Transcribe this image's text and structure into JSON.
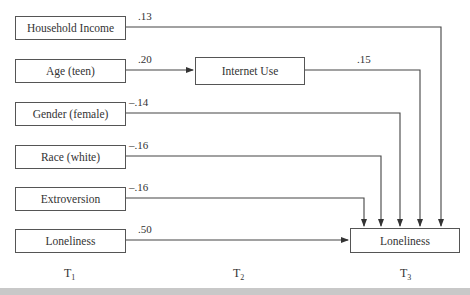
{
  "diagram": {
    "type": "path-model",
    "t1_nodes": [
      {
        "label": "Household Income",
        "coef": ".13"
      },
      {
        "label": "Age (teen)",
        "coef": ".20"
      },
      {
        "label": "Gender (female)",
        "coef": "–.14"
      },
      {
        "label": "Race (white)",
        "coef": "–.16"
      },
      {
        "label": "Extroversion",
        "coef": "–.16"
      },
      {
        "label": "Loneliness",
        "coef": ".50"
      }
    ],
    "t2_node": {
      "label": "Internet Use",
      "coef": ".15"
    },
    "t3_node": {
      "label": "Loneliness"
    },
    "time_labels": [
      {
        "base": "T",
        "sub": "1"
      },
      {
        "base": "T",
        "sub": "2"
      },
      {
        "base": "T",
        "sub": "3"
      }
    ],
    "edges": [
      {
        "from": "Household Income",
        "to": "Loneliness (T3)",
        "coef": ".13"
      },
      {
        "from": "Age (teen)",
        "to": "Internet Use",
        "coef": ".20"
      },
      {
        "from": "Internet Use",
        "to": "Loneliness (T3)",
        "coef": ".15"
      },
      {
        "from": "Gender (female)",
        "to": "Loneliness (T3)",
        "coef": "–.14"
      },
      {
        "from": "Race (white)",
        "to": "Loneliness (T3)",
        "coef": "–.16"
      },
      {
        "from": "Extroversion",
        "to": "Loneliness (T3)",
        "coef": "–.16"
      },
      {
        "from": "Loneliness (T1)",
        "to": "Loneliness (T3)",
        "coef": ".50"
      }
    ]
  }
}
